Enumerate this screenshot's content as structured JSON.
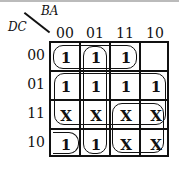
{
  "kmap": {
    "row_var": "DC",
    "col_var": "BA",
    "col_headers": [
      "00",
      "01",
      "11",
      "10"
    ],
    "row_headers": [
      "00",
      "01",
      "11",
      "10"
    ],
    "cells": [
      [
        "1",
        "1",
        "1",
        ""
      ],
      [
        "1",
        "1",
        "1",
        "1"
      ],
      [
        "X",
        "X",
        "X",
        "X"
      ],
      [
        "1",
        "1",
        "X",
        "X"
      ]
    ]
  }
}
